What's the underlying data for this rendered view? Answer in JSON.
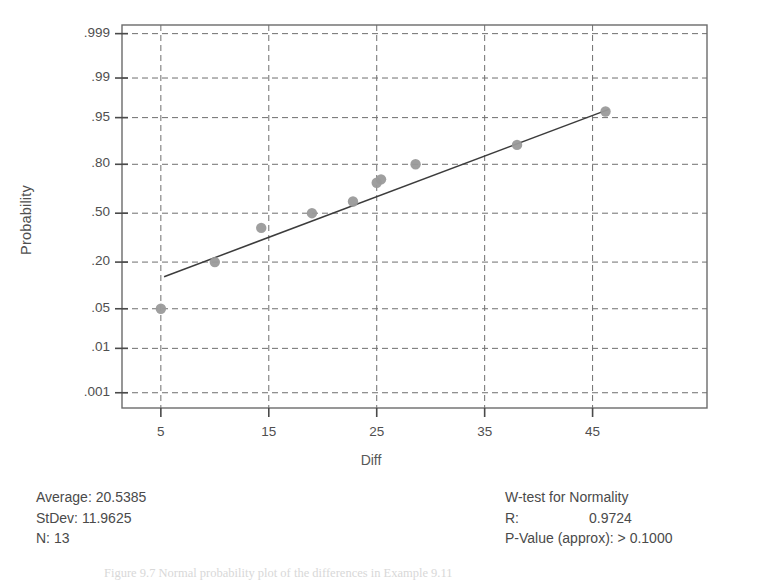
{
  "chart_data": {
    "type": "scatter",
    "title": "",
    "subtitle": "",
    "xlabel": "Diff",
    "ylabel": "Probability",
    "xlim": [
      1.4,
      55.6
    ],
    "ylim_probability": [
      0.0004,
      0.9994
    ],
    "grid": true,
    "legend": "none",
    "xticks": [
      "5",
      "15",
      "25",
      "35",
      "45"
    ],
    "xtick_values": [
      5,
      15,
      25,
      35,
      45
    ],
    "yticks": [
      ".999",
      ".99",
      ".95",
      ".80",
      ".50",
      ".20",
      ".05",
      ".01",
      ".001"
    ],
    "ytick_values": [
      0.999,
      0.99,
      0.95,
      0.8,
      0.5,
      0.2,
      0.05,
      0.01,
      0.001
    ],
    "points": [
      {
        "x": 5.0,
        "p": 0.05
      },
      {
        "x": 10.0,
        "p": 0.2
      },
      {
        "x": 14.3,
        "p": 0.4
      },
      {
        "x": 19.0,
        "p": 0.5
      },
      {
        "x": 22.8,
        "p": 0.58
      },
      {
        "x": 25.0,
        "p": 0.7
      },
      {
        "x": 25.4,
        "p": 0.72
      },
      {
        "x": 28.6,
        "p": 0.8
      },
      {
        "x": 38.0,
        "p": 0.88
      },
      {
        "x": 46.2,
        "p": 0.96
      }
    ],
    "fit_line": {
      "x0": 5.3,
      "p0": 0.137,
      "x1": 46.5,
      "p1": 0.963
    },
    "marker_color": "#9a9a9a",
    "line_color": "#3c3c3c",
    "grid_color": "#6f6f6f",
    "frame_color": "#6b6b6b"
  },
  "stats_left": {
    "average_label": "Average:",
    "average_value": "20.5385",
    "stdev_label": "StDev:",
    "stdev_value": "11.9625",
    "n_label": "N:",
    "n_value": "13"
  },
  "stats_right": {
    "heading": "W-test for Normality",
    "r_label": "R:",
    "r_value": "0.9724",
    "pvalue_label": "P-Value (approx):",
    "pvalue_value": "> 0.1000"
  },
  "caption": {
    "text": "Figure 9.7   Normal probability plot of the differences in Example 9.11"
  }
}
